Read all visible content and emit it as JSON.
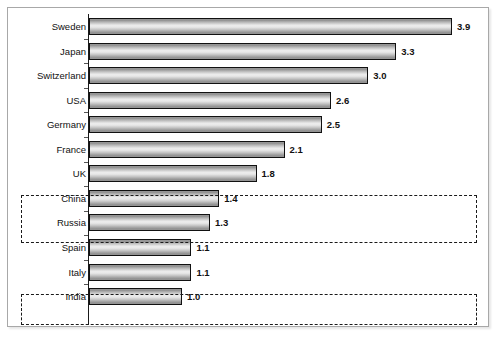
{
  "chart_data": {
    "type": "bar",
    "orientation": "horizontal",
    "title": "",
    "subtitle": "",
    "xlabel": "",
    "ylabel": "",
    "xlim": [
      0,
      4.2
    ],
    "grid": false,
    "legend": null,
    "value_label_format": "one-decimal",
    "categories": [
      "Sweden",
      "Japan",
      "Switzerland",
      "USA",
      "Germany",
      "France",
      "UK",
      "China",
      "Russia",
      "Spain",
      "Italy",
      "India"
    ],
    "values": [
      3.9,
      3.3,
      3.0,
      2.6,
      2.5,
      2.1,
      1.8,
      1.4,
      1.3,
      1.1,
      1.1,
      1.0
    ],
    "value_labels": [
      "3.9",
      "3.3",
      "3.0",
      "2.6",
      "2.5",
      "2.1",
      "1.8",
      "1.4",
      "1.3",
      "1.1",
      "1.1",
      "1.0"
    ],
    "annotations": [
      {
        "name": "highlight-box-china-russia",
        "type": "dashed-rectangle",
        "categories": [
          "China",
          "Russia"
        ]
      },
      {
        "name": "highlight-box-india",
        "type": "dashed-rectangle",
        "categories": [
          "India"
        ]
      }
    ]
  },
  "style": {
    "bar_outline": "#111111",
    "bar_fill_light": "#eeeeee",
    "bar_fill_dark": "#8c8c8c",
    "axis_color": "#1a1a1a",
    "frame_color": "#a8a8a8",
    "annotation_color": "#1a1a1a",
    "background": "#ffffff"
  },
  "geometry": {
    "axis_x": 89,
    "px_per_unit": 93.1,
    "bar_height": 17,
    "row_step": 24.55,
    "first_row_top": 18,
    "value_gap": 5,
    "boxes": [
      {
        "left": 21,
        "top": 195,
        "width": 456,
        "height": 48
      },
      {
        "left": 21,
        "top": 294,
        "width": 456,
        "height": 31
      }
    ]
  }
}
